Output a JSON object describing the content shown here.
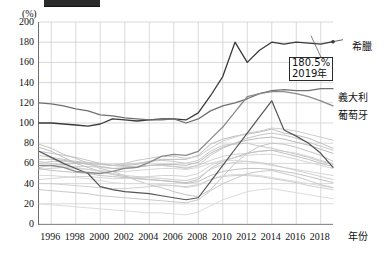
{
  "chart_data": {
    "type": "line",
    "title": "",
    "xlabel": "年份",
    "ylabel": "(%)",
    "xlim": [
      1995,
      2019
    ],
    "ylim": [
      0,
      200
    ],
    "ytick_step": 20,
    "grid": true,
    "legend_position": "right",
    "x": [
      1995,
      1996,
      1997,
      1998,
      1999,
      2000,
      2001,
      2002,
      2003,
      2004,
      2005,
      2006,
      2007,
      2008,
      2009,
      2010,
      2011,
      2012,
      2013,
      2014,
      2015,
      2016,
      2017,
      2018,
      2019
    ],
    "xticks": [
      "1996",
      "1998",
      "2000",
      "2002",
      "2004",
      "2006",
      "2008",
      "2010",
      "2012",
      "2014",
      "2016",
      "2018"
    ],
    "yticks": [
      "0",
      "20",
      "40",
      "60",
      "80",
      "100",
      "120",
      "140",
      "160",
      "180",
      "200"
    ],
    "annotations": [
      {
        "name": "greece-endpoint",
        "value": "180.5%",
        "year": "2019年",
        "at_x": 2019,
        "at_y": 180.5
      }
    ],
    "series": [
      {
        "name": "希臘",
        "label": "希臘",
        "color": "#3a3a3a",
        "width": 1.3,
        "values": [
          100,
          100,
          99,
          98,
          97,
          99,
          104,
          103,
          102,
          103,
          104,
          104,
          103,
          110,
          127,
          146,
          180,
          160,
          172,
          180,
          178,
          180,
          179,
          178,
          180.5
        ]
      },
      {
        "name": "義大利",
        "label": "義大利",
        "color": "#707070",
        "width": 1.3,
        "values": [
          120,
          119,
          117,
          114,
          112,
          108,
          107,
          105,
          104,
          103,
          103,
          104,
          100,
          104,
          112,
          117,
          120,
          124,
          129,
          132,
          133,
          132,
          132,
          134,
          134
        ]
      },
      {
        "name": "葡萄牙",
        "label": "葡萄牙",
        "color": "#8a8a8a",
        "width": 1.3,
        "values": [
          58,
          58,
          56,
          52,
          51,
          50,
          52,
          55,
          56,
          61,
          67,
          69,
          68,
          72,
          84,
          96,
          111,
          126,
          129,
          131,
          131,
          129,
          126,
          122,
          117
        ]
      },
      {
        "name": "other-1",
        "label": "",
        "color": "#c4c4c4",
        "width": 1.0,
        "values": [
          79,
          75,
          69,
          65,
          60,
          55,
          52,
          48,
          43,
          39,
          36,
          32,
          29,
          27,
          34,
          47,
          60,
          70,
          77,
          80,
          79,
          76,
          72,
          68,
          62
        ]
      },
      {
        "name": "other-2",
        "label": "",
        "color": "#bdbdbd",
        "width": 1.0,
        "values": [
          56,
          58,
          59,
          60,
          60,
          59,
          58,
          58,
          59,
          62,
          64,
          64,
          64,
          68,
          79,
          84,
          87,
          89,
          91,
          94,
          90,
          88,
          85,
          80,
          75
        ]
      },
      {
        "name": "other-3",
        "label": "",
        "color": "#cccccc",
        "width": 1.0,
        "values": [
          60,
          62,
          62,
          61,
          60,
          59,
          58,
          60,
          63,
          65,
          67,
          67,
          65,
          67,
          75,
          82,
          86,
          90,
          92,
          95,
          94,
          92,
          89,
          86,
          83
        ]
      },
      {
        "name": "other-4",
        "label": "",
        "color": "#c8c8c8",
        "width": 1.0,
        "values": [
          68,
          66,
          64,
          62,
          61,
          60,
          58,
          59,
          60,
          62,
          63,
          62,
          60,
          63,
          72,
          78,
          79,
          80,
          77,
          75,
          72,
          69,
          66,
          62,
          59
        ]
      },
      {
        "name": "other-5",
        "label": "",
        "color": "#d2d2d2",
        "width": 1.0,
        "values": [
          54,
          55,
          56,
          57,
          57,
          56,
          55,
          56,
          57,
          58,
          58,
          57,
          56,
          58,
          63,
          67,
          69,
          70,
          72,
          73,
          72,
          70,
          67,
          63,
          60
        ]
      },
      {
        "name": "other-6",
        "label": "",
        "color": "#bfbfbf",
        "width": 1.0,
        "values": [
          76,
          72,
          66,
          60,
          56,
          52,
          49,
          47,
          45,
          44,
          43,
          42,
          41,
          44,
          55,
          62,
          66,
          70,
          72,
          73,
          70,
          67,
          64,
          60,
          57
        ]
      },
      {
        "name": "other-7",
        "label": "",
        "color": "#d6d6d6",
        "width": 1.0,
        "values": [
          58,
          57,
          56,
          55,
          54,
          53,
          52,
          52,
          53,
          54,
          55,
          55,
          54,
          56,
          60,
          63,
          63,
          62,
          60,
          58,
          56,
          54,
          52,
          50,
          48
        ]
      },
      {
        "name": "other-8",
        "label": "",
        "color": "#cfcfcf",
        "width": 1.0,
        "values": [
          62,
          60,
          58,
          56,
          54,
          52,
          50,
          48,
          47,
          46,
          45,
          44,
          43,
          46,
          54,
          59,
          61,
          62,
          61,
          59,
          56,
          53,
          50,
          47,
          44
        ]
      },
      {
        "name": "other-9",
        "label": "",
        "color": "#c2c2c2",
        "width": 1.0,
        "values": [
          55,
          53,
          52,
          51,
          50,
          48,
          47,
          46,
          45,
          44,
          43,
          42,
          40,
          42,
          48,
          52,
          54,
          55,
          55,
          54,
          52,
          50,
          47,
          44,
          41
        ]
      },
      {
        "name": "other-10",
        "label": "",
        "color": "#dadada",
        "width": 1.0,
        "values": [
          48,
          48,
          47,
          46,
          45,
          43,
          41,
          40,
          40,
          40,
          39,
          38,
          36,
          38,
          44,
          48,
          49,
          49,
          48,
          46,
          44,
          42,
          40,
          38,
          36
        ]
      },
      {
        "name": "other-11",
        "label": "",
        "color": "#d0d0d0",
        "width": 1.0,
        "values": [
          40,
          40,
          39,
          38,
          37,
          36,
          35,
          35,
          36,
          37,
          38,
          38,
          37,
          39,
          44,
          47,
          48,
          48,
          47,
          45,
          43,
          41,
          38,
          36,
          34
        ]
      },
      {
        "name": "other-12",
        "label": "",
        "color": "#c9c9c9",
        "width": 1.0,
        "values": [
          34,
          33,
          32,
          31,
          30,
          28,
          27,
          26,
          25,
          24,
          23,
          22,
          21,
          24,
          33,
          40,
          45,
          50,
          52,
          53,
          50,
          47,
          43,
          39,
          36
        ]
      },
      {
        "name": "other-13",
        "label": "",
        "color": "#dcdcdc",
        "width": 1.0,
        "values": [
          20,
          19,
          18,
          17,
          16,
          15,
          14,
          13,
          12,
          11,
          11,
          10,
          9,
          12,
          18,
          24,
          28,
          32,
          34,
          35,
          33,
          31,
          29,
          27,
          25
        ]
      },
      {
        "name": "other-14",
        "label": "",
        "color": "#bbbbbb",
        "width": 1.0,
        "values": [
          64,
          64,
          63,
          61,
          59,
          57,
          55,
          55,
          56,
          58,
          59,
          59,
          58,
          61,
          70,
          76,
          80,
          83,
          85,
          86,
          84,
          81,
          78,
          74,
          70
        ]
      },
      {
        "name": "other-15",
        "label": "",
        "color": "#d4d4d4",
        "width": 1.0,
        "values": [
          44,
          45,
          46,
          47,
          47,
          46,
          45,
          45,
          46,
          47,
          48,
          48,
          47,
          50,
          58,
          63,
          66,
          68,
          69,
          69,
          67,
          64,
          61,
          58,
          55
        ]
      },
      {
        "name": "other-16",
        "label": "",
        "color": "#c6c6c6",
        "width": 1.0,
        "values": [
          72,
          70,
          68,
          66,
          63,
          60,
          58,
          57,
          57,
          58,
          58,
          57,
          55,
          58,
          68,
          75,
          80,
          85,
          88,
          90,
          88,
          85,
          81,
          77,
          73
        ]
      },
      {
        "name": "dark-spike",
        "label": "",
        "color": "#555555",
        "width": 1.2,
        "values": [
          72,
          66,
          60,
          55,
          50,
          37,
          34,
          32,
          31,
          30,
          28,
          26,
          24,
          26,
          42,
          58,
          74,
          90,
          106,
          122,
          93,
          87,
          80,
          70,
          56
        ]
      }
    ]
  },
  "labels": {
    "greece": "希臘",
    "italy": "義大利",
    "portugal": "葡萄牙",
    "unit_y": "(%)",
    "unit_x": "年份",
    "callout_value": "180.5%",
    "callout_year": "2019年"
  },
  "colors": {
    "greece": "#3a3a3a",
    "italy": "#707070",
    "portugal": "#8a8a8a",
    "grid": "#c9c9c9",
    "axis": "#6d6d6d"
  }
}
